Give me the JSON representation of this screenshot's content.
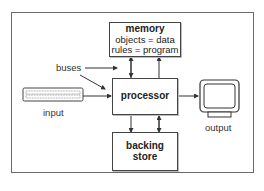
{
  "diagram": {
    "nodes": {
      "memory": {
        "title": "memory",
        "lines": [
          "objects = data",
          "rules = program"
        ]
      },
      "processor": {
        "title": "processor"
      },
      "backing_store": {
        "title_line1": "backing",
        "title_line2": "store"
      },
      "input": {
        "label": "input",
        "icon": "keyboard-icon"
      },
      "output": {
        "label": "output",
        "icon": "monitor-icon"
      }
    },
    "annotations": {
      "buses": "buses"
    },
    "edges": [
      {
        "from": "input",
        "to": "processor"
      },
      {
        "from": "processor",
        "to": "output"
      },
      {
        "from": "processor",
        "to": "memory",
        "bidirectional": true
      },
      {
        "from": "processor",
        "to": "backing_store",
        "bidirectional": true
      },
      {
        "from": "buses",
        "to": "memory-processor-bus"
      },
      {
        "from": "buses",
        "to": "processor"
      }
    ],
    "colors": {
      "stroke": "#444444",
      "frame": "#6a6a6a",
      "background": "#ffffff"
    }
  }
}
